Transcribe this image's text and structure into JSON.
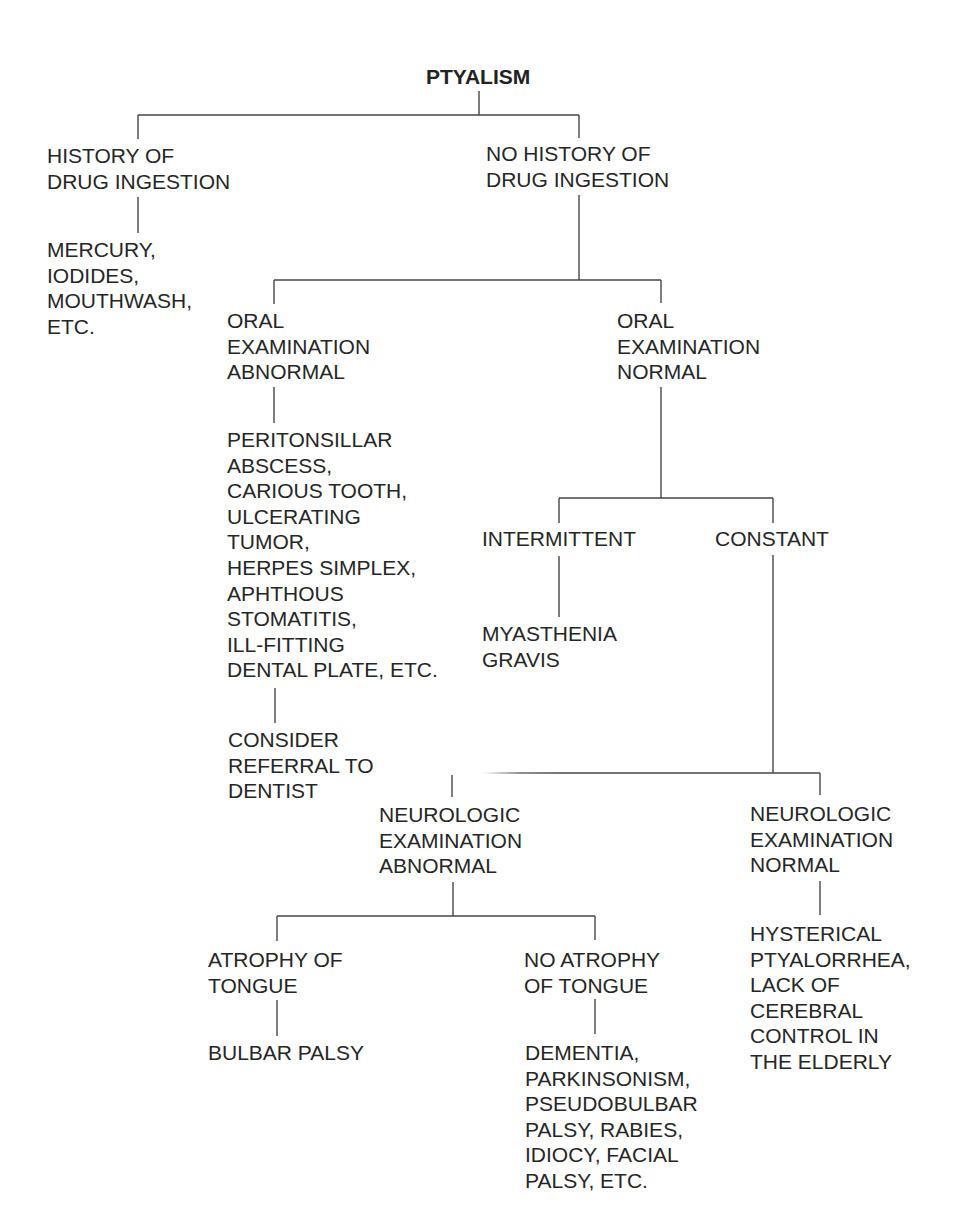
{
  "diagram": {
    "title": "PTYALISM",
    "type": "decision-tree"
  },
  "nodes": {
    "root": {
      "text": "PTYALISM"
    },
    "history_drug": {
      "text": "HISTORY OF\nDRUG INGESTION"
    },
    "history_drug_causes": {
      "text": "MERCURY,\nIODIDES,\nMOUTHWASH,\nETC."
    },
    "no_history_drug": {
      "text": "NO HISTORY OF\nDRUG INGESTION"
    },
    "oral_abnormal": {
      "text": "ORAL\nEXAMINATION\nABNORMAL"
    },
    "oral_abnormal_causes": {
      "text": "PERITONSILLAR\nABSCESS,\nCARIOUS TOOTH,\nULCERATING\nTUMOR,\nHERPES SIMPLEX,\nAPHTHOUS\nSTOMATITIS,\nILL-FITTING\nDENTAL PLATE, ETC."
    },
    "dentist_referral": {
      "text": "CONSIDER\nREFERRAL TO\nDENTIST"
    },
    "oral_normal": {
      "text": "ORAL\nEXAMINATION\nNORMAL"
    },
    "intermittent": {
      "text": "INTERMITTENT"
    },
    "myasthenia": {
      "text": "MYASTHENIA\nGRAVIS"
    },
    "constant": {
      "text": "CONSTANT"
    },
    "neuro_abnormal": {
      "text": "NEUROLOGIC\nEXAMINATION\nABNORMAL"
    },
    "neuro_normal": {
      "text": "NEUROLOGIC\nEXAMINATION\nNORMAL"
    },
    "tongue_atrophy": {
      "text": "ATROPHY OF\nTONGUE"
    },
    "bulbar_palsy": {
      "text": "BULBAR PALSY"
    },
    "no_tongue_atrophy": {
      "text": "NO ATROPHY\nOF TONGUE"
    },
    "no_atrophy_causes": {
      "text": "DEMENTIA,\nPARKINSONISM,\nPSEUDOBULBAR\nPALSY, RABIES,\nIDIOCY, FACIAL\nPALSY, ETC."
    },
    "hysterical": {
      "text": "HYSTERICAL\nPTYALORRHEA,\nLACK OF\nCEREBRAL\nCONTROL IN\nTHE ELDERLY"
    }
  },
  "edges": [
    [
      "root",
      "history_drug"
    ],
    [
      "root",
      "no_history_drug"
    ],
    [
      "history_drug",
      "history_drug_causes"
    ],
    [
      "no_history_drug",
      "oral_abnormal"
    ],
    [
      "no_history_drug",
      "oral_normal"
    ],
    [
      "oral_abnormal",
      "oral_abnormal_causes"
    ],
    [
      "oral_abnormal_causes",
      "dentist_referral"
    ],
    [
      "oral_normal",
      "intermittent"
    ],
    [
      "oral_normal",
      "constant"
    ],
    [
      "intermittent",
      "myasthenia"
    ],
    [
      "constant",
      "neuro_abnormal"
    ],
    [
      "constant",
      "neuro_normal"
    ],
    [
      "neuro_abnormal",
      "tongue_atrophy"
    ],
    [
      "neuro_abnormal",
      "no_tongue_atrophy"
    ],
    [
      "tongue_atrophy",
      "bulbar_palsy"
    ],
    [
      "no_tongue_atrophy",
      "no_atrophy_causes"
    ],
    [
      "neuro_normal",
      "hysterical"
    ]
  ],
  "colors": {
    "background": "#ffffff",
    "text": "#262626",
    "connector": "#464646"
  }
}
